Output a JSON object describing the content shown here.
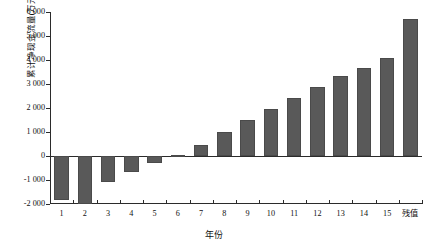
{
  "chart_data": {
    "type": "bar",
    "title": "",
    "xlabel": "年份",
    "ylabel": "累计净现金流量(万元)",
    "categories": [
      "1",
      "2",
      "3",
      "4",
      "5",
      "6",
      "7",
      "8",
      "9",
      "10",
      "11",
      "12",
      "13",
      "14",
      "15",
      "残值"
    ],
    "values": [
      -1850,
      -1980,
      -1100,
      -680,
      -280,
      60,
      450,
      1020,
      1500,
      1960,
      2400,
      2880,
      3330,
      3680,
      4100,
      5700
    ],
    "ylim": [
      -2000,
      6000
    ],
    "ytick_values": [
      -2000,
      -1000,
      0,
      1000,
      2000,
      3000,
      4000,
      5000,
      6000
    ],
    "ytick_labels": [
      "-2 000",
      "-1 000",
      "0",
      "1 000",
      "2 000",
      "3 000",
      "4 000",
      "5 000",
      "6 000"
    ],
    "grid": false,
    "legend": "none",
    "series": [
      {
        "name": "累计净现金流量",
        "color": "#595959",
        "values": [
          -1850,
          -1980,
          -1100,
          -680,
          -280,
          60,
          450,
          1020,
          1500,
          1960,
          2400,
          2880,
          3330,
          3680,
          4100,
          5700
        ]
      }
    ]
  }
}
